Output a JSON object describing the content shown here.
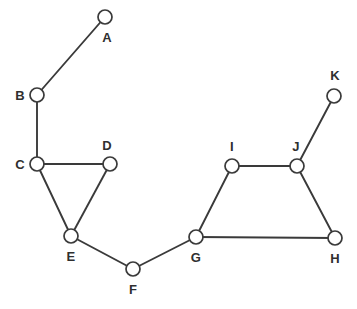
{
  "figure": {
    "width": 357,
    "height": 309,
    "background_color": "#ffffff",
    "edge_color": "#3a3a3a",
    "node_fill_color": "#ffffff",
    "node_stroke_color": "#3a3a3a",
    "label_color": "#2f2f2f",
    "node_radius": 7
  },
  "caption": {
    "clipped_text": ""
  },
  "chart_data": {
    "type": "diagram",
    "subtype": "node-link-graph",
    "directed": false,
    "weighted": false,
    "title": "",
    "node_count": 11,
    "edge_count": 12,
    "nodes": [
      {
        "id": "A",
        "label": "A",
        "x": 105,
        "y": 17,
        "label_x": 107,
        "label_y": 37,
        "label_pos": "below-right"
      },
      {
        "id": "B",
        "label": "B",
        "x": 37,
        "y": 95,
        "label_x": 20,
        "label_y": 95,
        "label_pos": "left"
      },
      {
        "id": "C",
        "label": "C",
        "x": 37,
        "y": 164,
        "label_x": 20,
        "label_y": 164,
        "label_pos": "left"
      },
      {
        "id": "D",
        "label": "D",
        "x": 110,
        "y": 164,
        "label_x": 107,
        "label_y": 145,
        "label_pos": "above"
      },
      {
        "id": "E",
        "label": "E",
        "x": 71,
        "y": 236,
        "label_x": 71,
        "label_y": 256,
        "label_pos": "below"
      },
      {
        "id": "F",
        "label": "F",
        "x": 133,
        "y": 269,
        "label_x": 133,
        "label_y": 289,
        "label_pos": "below"
      },
      {
        "id": "G",
        "label": "G",
        "x": 196,
        "y": 237,
        "label_x": 196,
        "label_y": 257,
        "label_pos": "below"
      },
      {
        "id": "H",
        "label": "H",
        "x": 335,
        "y": 238,
        "label_x": 335,
        "label_y": 258,
        "label_pos": "below"
      },
      {
        "id": "I",
        "label": "I",
        "x": 232,
        "y": 166,
        "label_x": 232,
        "label_y": 146,
        "label_pos": "above"
      },
      {
        "id": "J",
        "label": "J",
        "x": 297,
        "y": 166,
        "label_x": 296,
        "label_y": 146,
        "label_pos": "above"
      },
      {
        "id": "K",
        "label": "K",
        "x": 334,
        "y": 96,
        "label_x": 335,
        "label_y": 75,
        "label_pos": "above"
      }
    ],
    "edges": [
      {
        "source": "A",
        "target": "B"
      },
      {
        "source": "B",
        "target": "C"
      },
      {
        "source": "C",
        "target": "D"
      },
      {
        "source": "C",
        "target": "E"
      },
      {
        "source": "D",
        "target": "E"
      },
      {
        "source": "E",
        "target": "F"
      },
      {
        "source": "F",
        "target": "G"
      },
      {
        "source": "G",
        "target": "I"
      },
      {
        "source": "G",
        "target": "H"
      },
      {
        "source": "I",
        "target": "J"
      },
      {
        "source": "J",
        "target": "H"
      },
      {
        "source": "J",
        "target": "K"
      }
    ],
    "adjacency": {
      "A": [
        "B"
      ],
      "B": [
        "A",
        "C"
      ],
      "C": [
        "B",
        "D",
        "E"
      ],
      "D": [
        "C",
        "E"
      ],
      "E": [
        "C",
        "D",
        "F"
      ],
      "F": [
        "E",
        "G"
      ],
      "G": [
        "F",
        "I",
        "H"
      ],
      "H": [
        "G",
        "J"
      ],
      "I": [
        "G",
        "J"
      ],
      "J": [
        "I",
        "H",
        "K"
      ],
      "K": [
        "J"
      ]
    },
    "degrees": {
      "A": 1,
      "B": 2,
      "C": 3,
      "D": 2,
      "E": 3,
      "F": 2,
      "G": 3,
      "H": 2,
      "I": 2,
      "J": 3,
      "K": 1
    }
  }
}
